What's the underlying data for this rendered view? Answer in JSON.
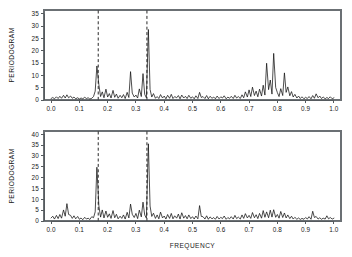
{
  "figure": {
    "title": "",
    "background": "#ffffff",
    "line_color": "#111111",
    "axis_color": "#555a5e",
    "panels": 2
  },
  "axis_titles": {
    "x": "FREQUENCY",
    "y": "PERIODOGRAM"
  },
  "chart_data": [
    {
      "type": "line",
      "panel": "top",
      "title": "",
      "xlabel": "",
      "ylabel": "PERIODOGRAM",
      "xlim": [
        -0.025,
        1.025
      ],
      "ylim": [
        0,
        36.5
      ],
      "xticks": [
        0.0,
        0.1,
        0.2,
        0.3,
        0.4,
        0.5,
        0.6,
        0.7,
        0.8,
        0.9,
        1.0
      ],
      "xticklabels": [
        "0.0",
        "0.1",
        "0.2",
        "0.3",
        "0.4",
        "0.5",
        "0.6",
        "0.7",
        "0.8",
        "0.9",
        "1.0"
      ],
      "yticks": [
        0,
        5,
        10,
        15,
        20,
        25,
        30,
        35
      ],
      "yticklabels": [
        "0",
        "5",
        "10",
        "15",
        "20",
        "25",
        "30",
        "35"
      ],
      "grid": false,
      "legend": "none",
      "annotations": [
        {
          "type": "vline",
          "x": 0.1667,
          "style": "dashed",
          "color": "#111111"
        },
        {
          "type": "vline",
          "x": 0.3389,
          "style": "dashed",
          "color": "#111111"
        }
      ],
      "x": [
        0.0,
        0.006,
        0.012,
        0.019,
        0.025,
        0.031,
        0.037,
        0.044,
        0.05,
        0.056,
        0.062,
        0.069,
        0.075,
        0.081,
        0.087,
        0.094,
        0.1,
        0.106,
        0.112,
        0.119,
        0.125,
        0.131,
        0.137,
        0.144,
        0.15,
        0.156,
        0.162,
        0.169,
        0.175,
        0.181,
        0.187,
        0.194,
        0.2,
        0.206,
        0.212,
        0.219,
        0.225,
        0.231,
        0.237,
        0.244,
        0.25,
        0.256,
        0.262,
        0.269,
        0.275,
        0.281,
        0.287,
        0.294,
        0.3,
        0.306,
        0.312,
        0.319,
        0.325,
        0.331,
        0.337,
        0.344,
        0.35,
        0.356,
        0.362,
        0.369,
        0.375,
        0.381,
        0.387,
        0.394,
        0.4,
        0.406,
        0.412,
        0.419,
        0.425,
        0.431,
        0.437,
        0.444,
        0.45,
        0.456,
        0.462,
        0.469,
        0.475,
        0.481,
        0.487,
        0.494,
        0.5,
        0.506,
        0.512,
        0.519,
        0.525,
        0.531,
        0.537,
        0.544,
        0.55,
        0.556,
        0.562,
        0.569,
        0.575,
        0.581,
        0.587,
        0.594,
        0.6,
        0.606,
        0.612,
        0.619,
        0.625,
        0.631,
        0.637,
        0.644,
        0.65,
        0.656,
        0.662,
        0.669,
        0.675,
        0.681,
        0.687,
        0.694,
        0.7,
        0.706,
        0.712,
        0.719,
        0.725,
        0.731,
        0.737,
        0.744,
        0.75,
        0.756,
        0.762,
        0.769,
        0.775,
        0.781,
        0.787,
        0.794,
        0.8,
        0.806,
        0.812,
        0.819,
        0.825,
        0.831,
        0.837,
        0.844,
        0.85,
        0.856,
        0.862,
        0.869,
        0.875,
        0.881,
        0.887,
        0.894,
        0.9,
        0.906,
        0.912,
        0.919,
        0.925,
        0.931,
        0.937,
        0.944,
        0.95,
        0.956,
        0.962,
        0.969,
        0.975,
        0.981,
        0.987,
        0.994,
        1.0
      ],
      "y": [
        0.6,
        1.0,
        0.5,
        1.3,
        0.6,
        1.5,
        0.7,
        1.9,
        0.8,
        2.1,
        0.9,
        1.6,
        0.7,
        1.2,
        0.5,
        0.9,
        0.4,
        0.8,
        0.5,
        1.1,
        0.6,
        0.9,
        0.4,
        0.7,
        1.4,
        3.6,
        13.8,
        6.2,
        1.4,
        3.3,
        0.9,
        4.4,
        1.2,
        2.6,
        0.8,
        3.9,
        1.1,
        2.4,
        0.7,
        1.9,
        0.9,
        2.2,
        0.6,
        3.1,
        1.0,
        11.5,
        2.8,
        1.2,
        2.0,
        0.8,
        4.5,
        1.4,
        10.7,
        2.3,
        0.9,
        28.6,
        4.3,
        1.2,
        2.6,
        0.7,
        1.4,
        0.6,
        2.2,
        0.8,
        1.6,
        0.5,
        1.9,
        0.7,
        2.3,
        0.6,
        1.4,
        0.9,
        1.8,
        0.5,
        2.0,
        0.8,
        1.5,
        0.6,
        1.9,
        0.7,
        1.3,
        0.5,
        1.7,
        0.6,
        3.1,
        1.0,
        1.4,
        0.6,
        1.8,
        0.5,
        1.5,
        0.7,
        1.2,
        0.5,
        1.6,
        0.6,
        1.3,
        0.8,
        1.7,
        0.5,
        1.2,
        0.7,
        1.5,
        0.6,
        1.9,
        0.8,
        1.4,
        0.6,
        2.1,
        0.9,
        3.3,
        1.2,
        4.1,
        1.4,
        5.2,
        1.8,
        3.6,
        1.3,
        4.4,
        1.6,
        6.0,
        2.0,
        14.9,
        4.2,
        8.1,
        2.4,
        18.9,
        5.1,
        3.0,
        1.4,
        4.6,
        1.8,
        11.0,
        3.1,
        5.3,
        1.7,
        3.4,
        1.2,
        2.3,
        0.8,
        1.6,
        0.6,
        1.3,
        0.5,
        1.1,
        0.6,
        1.4,
        0.5,
        1.8,
        0.7,
        2.5,
        0.9,
        1.6,
        0.6,
        1.2,
        0.5,
        1.0,
        0.6,
        1.3,
        0.5,
        0.9,
        0.6,
        1.1,
        0.5
      ]
    },
    {
      "type": "line",
      "panel": "bottom",
      "title": "",
      "xlabel": "FREQUENCY",
      "ylabel": "PERIODOGRAM",
      "xlim": [
        -0.025,
        1.025
      ],
      "ylim": [
        0,
        41.5
      ],
      "xticks": [
        0.0,
        0.1,
        0.2,
        0.3,
        0.4,
        0.5,
        0.6,
        0.7,
        0.8,
        0.9,
        1.0
      ],
      "xticklabels": [
        "0.0",
        "0.1",
        "0.2",
        "0.3",
        "0.4",
        "0.5",
        "0.6",
        "0.7",
        "0.8",
        "0.9",
        "1.0"
      ],
      "yticks": [
        0,
        5,
        10,
        15,
        20,
        25,
        30,
        35,
        40
      ],
      "yticklabels": [
        "0",
        "5",
        "10",
        "15",
        "20",
        "25",
        "30",
        "35",
        "40"
      ],
      "grid": false,
      "legend": "none",
      "annotations": [
        {
          "type": "vline",
          "x": 0.1667,
          "style": "dashed",
          "color": "#111111"
        },
        {
          "type": "vline",
          "x": 0.3389,
          "style": "dashed",
          "color": "#111111"
        }
      ],
      "x": [
        0.0,
        0.006,
        0.012,
        0.019,
        0.025,
        0.031,
        0.037,
        0.044,
        0.05,
        0.056,
        0.062,
        0.069,
        0.075,
        0.081,
        0.087,
        0.094,
        0.1,
        0.106,
        0.112,
        0.119,
        0.125,
        0.131,
        0.137,
        0.144,
        0.15,
        0.156,
        0.162,
        0.169,
        0.175,
        0.181,
        0.187,
        0.194,
        0.2,
        0.206,
        0.212,
        0.219,
        0.225,
        0.231,
        0.237,
        0.244,
        0.25,
        0.256,
        0.262,
        0.269,
        0.275,
        0.281,
        0.287,
        0.294,
        0.3,
        0.306,
        0.312,
        0.319,
        0.325,
        0.331,
        0.337,
        0.344,
        0.35,
        0.356,
        0.362,
        0.369,
        0.375,
        0.381,
        0.387,
        0.394,
        0.4,
        0.406,
        0.412,
        0.419,
        0.425,
        0.431,
        0.437,
        0.444,
        0.45,
        0.456,
        0.462,
        0.469,
        0.475,
        0.481,
        0.487,
        0.494,
        0.5,
        0.506,
        0.512,
        0.519,
        0.525,
        0.531,
        0.537,
        0.544,
        0.55,
        0.556,
        0.562,
        0.569,
        0.575,
        0.581,
        0.587,
        0.594,
        0.6,
        0.606,
        0.612,
        0.619,
        0.625,
        0.631,
        0.637,
        0.644,
        0.65,
        0.656,
        0.662,
        0.669,
        0.675,
        0.681,
        0.687,
        0.694,
        0.7,
        0.706,
        0.712,
        0.719,
        0.725,
        0.731,
        0.737,
        0.744,
        0.75,
        0.756,
        0.762,
        0.769,
        0.775,
        0.781,
        0.787,
        0.794,
        0.8,
        0.806,
        0.812,
        0.819,
        0.825,
        0.831,
        0.837,
        0.844,
        0.85,
        0.856,
        0.862,
        0.869,
        0.875,
        0.881,
        0.887,
        0.894,
        0.9,
        0.906,
        0.912,
        0.919,
        0.925,
        0.931,
        0.937,
        0.944,
        0.95,
        0.956,
        0.962,
        0.969,
        0.975,
        0.981,
        0.987,
        0.994,
        1.0
      ],
      "y": [
        1.4,
        2.2,
        0.9,
        2.6,
        1.1,
        3.0,
        1.3,
        5.1,
        2.2,
        8.0,
        3.0,
        2.6,
        1.2,
        2.4,
        1.0,
        2.1,
        0.8,
        1.4,
        0.6,
        1.7,
        0.9,
        1.3,
        0.7,
        2.0,
        1.5,
        4.2,
        24.8,
        7.0,
        1.8,
        5.1,
        1.4,
        4.6,
        1.7,
        3.3,
        1.2,
        4.8,
        1.5,
        3.1,
        1.0,
        2.2,
        1.2,
        2.8,
        0.9,
        4.0,
        1.4,
        7.8,
        3.1,
        1.6,
        3.5,
        1.1,
        5.0,
        1.9,
        8.7,
        2.8,
        1.3,
        35.6,
        6.9,
        2.1,
        3.6,
        1.2,
        2.8,
        1.0,
        4.1,
        1.4,
        2.3,
        0.9,
        3.0,
        1.2,
        3.5,
        1.0,
        2.4,
        1.3,
        3.2,
        0.9,
        3.8,
        1.3,
        2.5,
        1.0,
        2.8,
        1.1,
        2.0,
        0.9,
        2.3,
        1.0,
        7.1,
        2.1,
        2.0,
        0.9,
        2.4,
        0.8,
        1.9,
        1.0,
        1.6,
        0.8,
        2.1,
        0.9,
        1.7,
        1.1,
        2.3,
        0.8,
        1.6,
        1.0,
        2.0,
        0.9,
        2.6,
        1.1,
        1.8,
        0.9,
        2.8,
        1.2,
        3.4,
        1.4,
        2.6,
        1.2,
        3.9,
        1.5,
        2.9,
        1.1,
        3.5,
        1.3,
        4.8,
        1.7,
        4.2,
        1.5,
        5.0,
        1.8,
        5.2,
        1.7,
        3.0,
        1.3,
        4.4,
        1.6,
        3.7,
        1.4,
        2.8,
        1.1,
        2.2,
        0.9,
        1.7,
        0.8,
        1.4,
        0.7,
        1.2,
        0.8,
        1.6,
        0.9,
        2.0,
        0.8,
        4.5,
        1.6,
        2.1,
        0.9,
        1.5,
        0.8,
        1.3,
        0.9,
        2.4,
        1.0,
        1.6,
        0.9,
        1.3,
        1.1
      ]
    }
  ]
}
